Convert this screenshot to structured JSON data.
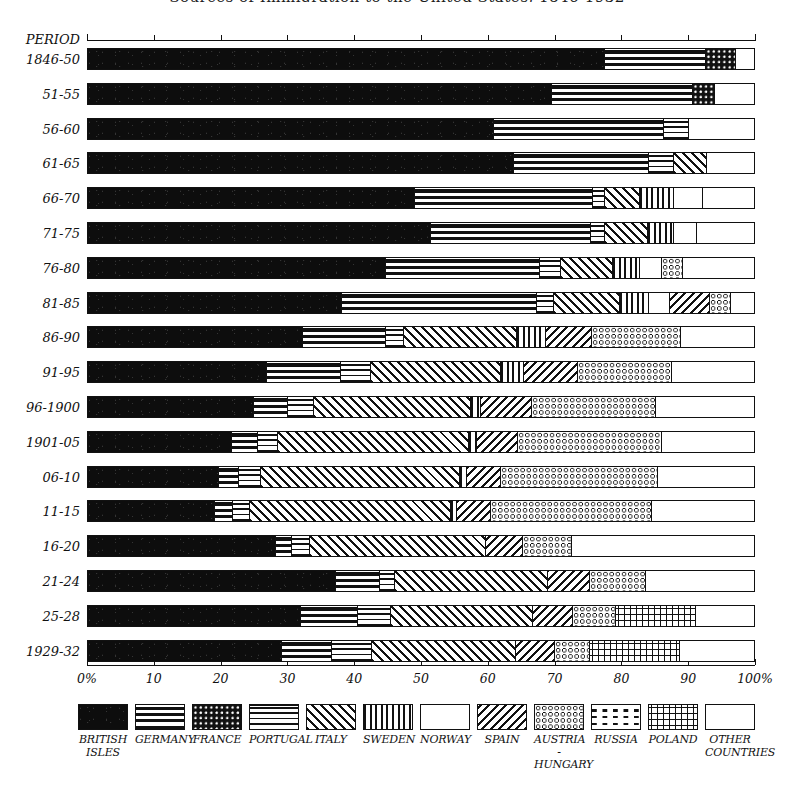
{
  "title": "Sources of Immigration to the United States, 1846-1932",
  "axis": {
    "row_header": "PERIOD",
    "ticks": [
      0,
      10,
      20,
      30,
      40,
      50,
      60,
      70,
      80,
      90,
      100
    ],
    "tick_labels": [
      "0%",
      "10",
      "20",
      "30",
      "40",
      "50",
      "60",
      "70",
      "80",
      "90",
      "100%"
    ],
    "min": 0,
    "max": 100
  },
  "legend": {
    "items": [
      {
        "key": "british",
        "label": "BRITISH\nISLES",
        "pattern": "solid-black"
      },
      {
        "key": "germany",
        "label": "GERMANY",
        "pattern": "thick-horizontal-bands"
      },
      {
        "key": "france",
        "label": "FRANCE",
        "pattern": "white-dots-on-black"
      },
      {
        "key": "portugal",
        "label": "PORTUGAL",
        "pattern": "thin-horizontal-lines"
      },
      {
        "key": "italy",
        "label": "ITALY",
        "pattern": "diagonal-hatch-up"
      },
      {
        "key": "sweden",
        "label": "SWEDEN",
        "pattern": "vertical-lines"
      },
      {
        "key": "norway",
        "label": "NORWAY",
        "pattern": "horizontal-dashes"
      },
      {
        "key": "spain",
        "label": "SPAIN",
        "pattern": "diagonal-hatch-down"
      },
      {
        "key": "austria",
        "label": "AUSTRIA\n-HUNGARY",
        "pattern": "small-circles"
      },
      {
        "key": "russia",
        "label": "RUSSIA",
        "pattern": "long-dashes"
      },
      {
        "key": "poland",
        "label": "POLAND",
        "pattern": "plus-signs"
      },
      {
        "key": "other",
        "label": "OTHER\nCOUNTRIES",
        "pattern": "blank-white"
      }
    ]
  },
  "chart_data": {
    "type": "bar",
    "subtype": "100-percent-stacked-horizontal",
    "title": "Sources of Immigration to the United States, 1846-1932",
    "xlabel": "",
    "ylabel": "PERIOD",
    "xlim": [
      0,
      100
    ],
    "grid": false,
    "legend_position": "bottom",
    "units": "percent of total immigration",
    "categories": [
      "1846-50",
      "51-55",
      "56-60",
      "61-65",
      "66-70",
      "71-75",
      "76-80",
      "81-85",
      "86-90",
      "91-95",
      "96-1900",
      "1901-05",
      "06-10",
      "11-15",
      "16-20",
      "21-24",
      "25-28",
      "1929-32"
    ],
    "series_order": [
      "british",
      "germany",
      "france",
      "portugal",
      "italy",
      "sweden",
      "norway",
      "spain",
      "austria",
      "russia",
      "poland",
      "other"
    ],
    "series": [
      {
        "name": "BRITISH ISLES",
        "key": "british",
        "values": [
          77.4,
          69.5,
          60.8,
          63.8,
          49.0,
          51.3,
          44.6,
          38.0,
          32.2,
          26.8,
          24.9,
          21.6,
          19.6,
          19.0,
          28.1,
          37.1,
          31.9,
          29.0
        ]
      },
      {
        "name": "GERMANY",
        "key": "germany",
        "values": [
          15.1,
          21.0,
          25.4,
          20.2,
          26.6,
          24.0,
          23.1,
          29.2,
          12.4,
          11.1,
          5.1,
          3.9,
          3.0,
          2.7,
          2.4,
          6.6,
          8.5,
          7.5
        ]
      },
      {
        "name": "FRANCE",
        "key": "france",
        "values": [
          4.5,
          3.3,
          0.0,
          0.0,
          0.0,
          0.0,
          0.0,
          0.0,
          0.0,
          0.0,
          0.0,
          0.0,
          0.0,
          0.0,
          0.0,
          0.0,
          0.0,
          0.0
        ]
      },
      {
        "name": "PORTUGAL",
        "key": "portugal",
        "values": [
          0.0,
          0.0,
          3.7,
          3.7,
          1.8,
          2.1,
          3.1,
          2.6,
          2.7,
          4.5,
          3.9,
          2.9,
          3.3,
          2.5,
          2.8,
          2.2,
          5.0,
          6.0
        ]
      },
      {
        "name": "ITALY",
        "key": "italy",
        "values": [
          0.0,
          0.0,
          0.0,
          4.9,
          5.2,
          6.4,
          7.8,
          9.9,
          16.9,
          19.5,
          23.4,
          28.6,
          29.8,
          30.1,
          26.3,
          23.0,
          21.2,
          21.6
        ]
      },
      {
        "name": "SWEDEN",
        "key": "sweden",
        "values": [
          0.0,
          0.0,
          0.0,
          0.0,
          5.1,
          3.9,
          4.0,
          4.3,
          4.3,
          3.3,
          1.5,
          1.3,
          1.0,
          1.0,
          0.0,
          0.0,
          0.0,
          0.0
        ]
      },
      {
        "name": "NORWAY",
        "key": "norway",
        "values": [
          0.0,
          0.0,
          0.0,
          0.0,
          4.3,
          3.4,
          3.4,
          3.1,
          0.0,
          0.0,
          0.0,
          0.0,
          0.0,
          0.0,
          0.0,
          0.0,
          0.0,
          0.0
        ]
      },
      {
        "name": "SPAIN",
        "key": "spain",
        "values": [
          0.0,
          0.0,
          0.0,
          0.0,
          0.0,
          0.0,
          0.0,
          6.0,
          7.0,
          8.2,
          7.7,
          6.0,
          5.1,
          5.0,
          5.5,
          6.2,
          6.0,
          5.8
        ]
      },
      {
        "name": "AUSTRIA-HUNGARY",
        "key": "austria",
        "values": [
          0.0,
          0.0,
          0.0,
          0.0,
          0.0,
          0.0,
          3.1,
          3.1,
          13.2,
          14.0,
          18.5,
          21.6,
          23.6,
          24.1,
          7.3,
          8.5,
          6.4,
          5.2
        ]
      },
      {
        "name": "RUSSIA",
        "key": "russia",
        "values": [
          0.0,
          0.0,
          0.0,
          0.0,
          0.0,
          0.0,
          0.0,
          0.0,
          4.9,
          5.6,
          5.3,
          5.3,
          6.0,
          6.2,
          0.0,
          0.0,
          0.0,
          0.0
        ]
      },
      {
        "name": "POLAND",
        "key": "poland",
        "values": [
          0.0,
          0.0,
          0.0,
          0.0,
          0.0,
          0.0,
          0.0,
          0.0,
          0.0,
          0.0,
          0.0,
          0.0,
          0.0,
          0.0,
          0.0,
          0.0,
          12.0,
          13.5
        ]
      },
      {
        "name": "OTHER COUNTRIES",
        "key": "other",
        "values": [
          3.0,
          6.2,
          10.1,
          7.4,
          8.0,
          8.9,
          10.9,
          3.8,
          6.4,
          7.0,
          9.7,
          8.8,
          8.6,
          9.4,
          27.6,
          16.4,
          9.0,
          11.4
        ]
      }
    ]
  }
}
